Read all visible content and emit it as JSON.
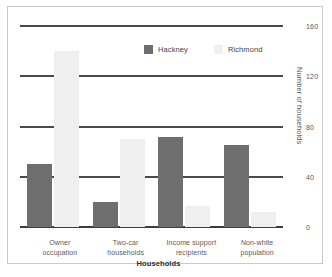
{
  "chart_data": {
    "type": "bar",
    "title": "",
    "xlabel": "Households",
    "ylabel": "Number of households",
    "ylim": [
      0,
      160
    ],
    "yticks": [
      0,
      40,
      80,
      120,
      160
    ],
    "ytick_labels": [
      "0",
      "40",
      "80",
      "120",
      "160"
    ],
    "grid": true,
    "legend_position": "top-center",
    "categories": [
      "Owner occupation",
      "Two-car households",
      "Income support recipients",
      "Non-white population"
    ],
    "category_lines": [
      [
        "Owner",
        "occupation"
      ],
      [
        "Two-car",
        "households"
      ],
      [
        "Income support",
        "recipients"
      ],
      [
        "Non-white",
        "population"
      ]
    ],
    "series": [
      {
        "name": "Hackney",
        "color": "#6e6e6e",
        "values": [
          50,
          20,
          72,
          65
        ]
      },
      {
        "name": "Richmond",
        "color": "#efefef",
        "values": [
          140,
          70,
          17,
          12
        ]
      }
    ]
  }
}
